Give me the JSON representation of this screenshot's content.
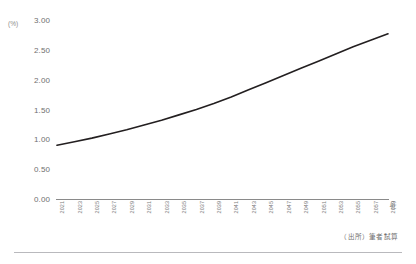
{
  "chart_data": {
    "type": "line",
    "title": "",
    "xlabel": "(年)",
    "ylabel": "(%)",
    "ylim": [
      0,
      3
    ],
    "xlim": [
      2021,
      2059
    ],
    "grid": false,
    "legend": false,
    "yticks": [
      "3.00",
      "2.50",
      "2.00",
      "1.50",
      "1.00",
      "0.50",
      "0.00"
    ],
    "ytick_values": [
      3.0,
      2.5,
      2.0,
      1.5,
      1.0,
      0.5,
      0.0
    ],
    "categories": [
      "2021",
      "2023",
      "2025",
      "2027",
      "2029",
      "2031",
      "2033",
      "2035",
      "2037",
      "2039",
      "2041",
      "2043",
      "2045",
      "2047",
      "2049",
      "2051",
      "2053",
      "2055",
      "2057",
      "2059"
    ],
    "series": [
      {
        "name": "",
        "color": "#231f20",
        "x": [
          2021,
          2023,
          2025,
          2027,
          2029,
          2031,
          2033,
          2035,
          2037,
          2039,
          2041,
          2043,
          2045,
          2047,
          2049,
          2051,
          2053,
          2055,
          2057,
          2059
        ],
        "values": [
          0.9,
          0.96,
          1.02,
          1.09,
          1.16,
          1.24,
          1.32,
          1.41,
          1.5,
          1.6,
          1.71,
          1.83,
          1.95,
          2.07,
          2.19,
          2.31,
          2.43,
          2.55,
          2.66,
          2.77
        ]
      }
    ],
    "annotations": [
      {
        "name": "source-note",
        "text": "（出所）筆者試算"
      }
    ]
  },
  "axes": {
    "y_unit": "(%)",
    "x_unit": "(年)"
  }
}
